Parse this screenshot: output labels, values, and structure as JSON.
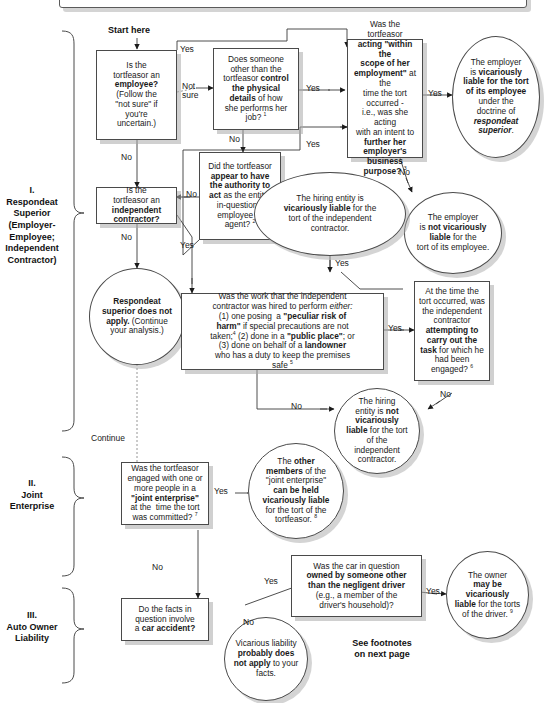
{
  "diagram": {
    "start_label": "Start here",
    "footnote_note": "See footnotes\non next page",
    "footnote_note_line1": "See footnotes",
    "footnote_note_line2": "on next page",
    "accent_color": "#1a1a1a",
    "shadow_color": "#aaaaaa"
  },
  "sections": [
    {
      "id": "section-1",
      "numeral": "I.",
      "title_lines": [
        "Respondeat",
        "Superior",
        "(Employer-",
        "Employee;",
        "Independent",
        "Contractor)"
      ]
    },
    {
      "id": "section-2",
      "numeral": "II.",
      "title_lines": [
        "Joint",
        "Enterprise"
      ]
    },
    {
      "id": "section-3",
      "numeral": "III.",
      "title_lines": [
        "Auto Owner",
        "Liability"
      ]
    }
  ],
  "nodes": {
    "q_employee": {
      "shape": "box",
      "text_html": "Is the<br>tortfeasor an<br><b>employee?</b><br>(Follow the<br>\"not sure\" if<br>you're<br>uncertain.)"
    },
    "q_control": {
      "shape": "box",
      "text_html": "Does someone<br>other than the<br>tortfeasor <b>control</b><br><b>the physical</b><br><b>details</b> of how<br>she performs her<br>job? <sup>1</sup>"
    },
    "q_scope": {
      "shape": "box",
      "text_html": "Was the tortfeasor<br><b>acting \"within the</b><br><b>scope of her</b><br><b>employment\"</b> at the<br>time the tort occurred -<br>i.e., was she acting<br>with an intent to<br><b>further her</b><br><b>employer's business</b><br><b>purpose?</b> <sup>3</sup>"
    },
    "r_employer_liable": {
      "shape": "ellipse",
      "text_html": "The employer<br>is <b>vicariously</b><br><b>liable for the tort</b><br><b>of its employee</b><br>under the<br>doctrine of<br><i><b>respondeat</b></i><br><i><b>superior</b></i>."
    },
    "r_employer_not_liable": {
      "shape": "ellipse",
      "text_html": "The employer<br>is <b>not vicariously</b><br><b>liable</b> for the<br>tort of its employee."
    },
    "q_authority": {
      "shape": "box",
      "text_html": "Did the tortfeasor<br><b>appear to have</b><br><b>the authority to</b><br><b>act</b> as the entity-<br>in-question's<br>employee or<br>agent? <sup>2</sup>"
    },
    "r_hiring_liable": {
      "shape": "ellipse",
      "text_html": "The hiring entity is<br><b>vicariously liable</b> for the<br>tort of the independent<br>contractor."
    },
    "q_indep_contractor": {
      "shape": "box",
      "text_html": "Is the<br>tortfeasor an<br><b>independent</b><br><b>contractor?</b>"
    },
    "r_rs_not_apply": {
      "shape": "ellipse",
      "text_html": "<b>Respondeat</b><br><b>superior does not</b><br><b>apply.</b> (Continue<br>your analysis.)"
    },
    "q_work_type": {
      "shape": "box",
      "text_html": "Was the work that the independent<br>contractor was hired to perform <i>either:</i><br>(1) one posing&nbsp; a <b>\"peculiar risk of</b><br><b>harm\"</b> if special precautions are not<br>taken;<sup>4</sup> (2) done in a <b>\"public place\"</b>; or<br>(3) done on behalf of a <b>landowner</b><br>who has a duty to keep the premises<br>safe <sup>5</sup>"
    },
    "q_carrying_out": {
      "shape": "box",
      "text_html": "At the time the<br>tort occurred, was<br>the independent<br>contractor<br><b>attempting to</b><br><b>carry out the</b><br><b>task</b> for which he<br>had been<br>engaged? <sup>6</sup>"
    },
    "r_hiring_not_liable": {
      "shape": "ellipse",
      "text_html": "The hiring<br>entity is <b>not</b><br><b>vicariously</b><br><b>liable</b> for the tort<br>of the<br>independent<br>contractor."
    },
    "q_joint_enterprise": {
      "shape": "box",
      "text_html": "Was the tortfeasor<br>engaged with one or<br>more people in a<br><b>\"joint enterprise\"</b><br>at the&nbsp; time the tort<br>was committed? <sup>7</sup>"
    },
    "r_joint_members": {
      "shape": "ellipse",
      "text_html": "The <b>other</b><br><b>members</b> of the<br>\"joint enterprise\"<br><b>can be held</b><br><b>vicariously liable</b><br>for the tort of the<br>tortfeasor. <sup>8</sup>"
    },
    "q_car_accident": {
      "shape": "box",
      "text_html": "Do the facts in<br>question involve<br>a <b>car accident?</b>"
    },
    "q_car_owner": {
      "shape": "box",
      "text_html": "Was the car in question<br><b>owned by someone other</b><br><b>than the negligent driver</b><br>(e.g., a member of the<br>driver's household)?"
    },
    "r_owner_liable": {
      "shape": "ellipse",
      "text_html": "The owner<br><b>may be</b><br><b>vicariously</b><br><b>liable</b> for the torts<br>of the driver. <sup>9</sup>"
    },
    "r_no_vl": {
      "shape": "ellipse",
      "text_html": "Vicarious liability<br><b>probably does</b><br><b>not apply</b> to your<br>facts."
    }
  },
  "edge_labels": {
    "employee_yes": "Yes",
    "employee_notsure_1": "Not",
    "employee_notsure_2": "sure",
    "employee_no": "No",
    "control_no": "No",
    "control_yes": "Yes",
    "scope_yes": "Yes",
    "scope_no": "No",
    "authority_no": "No",
    "authority_yes": "Yes",
    "hiring_liable_yes": "Yes",
    "indep_no": "No",
    "indep_yes": "Yes",
    "work_yes": "Yes",
    "work_no": "No",
    "carry_no": "No",
    "continue": "Continue",
    "joint_yes": "Yes",
    "joint_no": "No",
    "car_yes": "Yes",
    "car_no": "No",
    "owner_yes": "Yes"
  }
}
